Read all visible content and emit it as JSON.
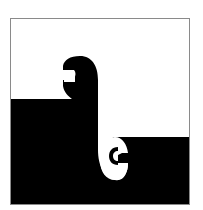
{
  "figure": {
    "colors": {
      "black": "#000000",
      "white": "#ffffff",
      "frame": "#8a8a8a"
    },
    "frame": {
      "x": 10,
      "y": 18,
      "width": 180,
      "height": 187
    },
    "step_left_y": 99,
    "step_right_y": 137,
    "scrolls": [
      {
        "name": "upper-left-scroll",
        "color": "black"
      },
      {
        "name": "lower-right-scroll",
        "color": "white"
      }
    ]
  }
}
